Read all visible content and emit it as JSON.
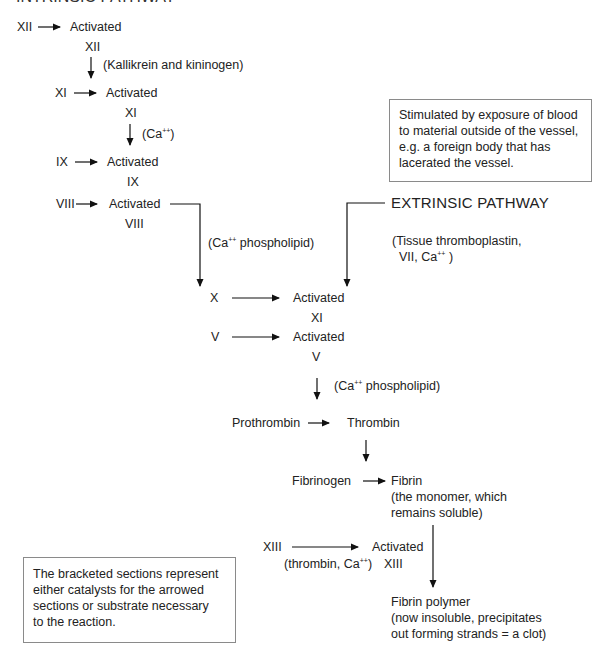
{
  "title": "INTRINSIC PATHWAY",
  "intrinsic": {
    "xii": {
      "source": "XII",
      "activated": "Activated",
      "sub": "XII"
    },
    "xii_catalyst": "(Kallikrein and kininogen)",
    "xi": {
      "source": "XI",
      "activated": "Activated",
      "sub": "XI"
    },
    "xi_catalyst_pre": "(Ca",
    "xi_catalyst_sup": "++",
    "xi_catalyst_post": ")",
    "ix": {
      "source": "IX",
      "activated": "Activated",
      "sub": "IX"
    },
    "viii": {
      "source": "VIII",
      "activated": "Activated",
      "sub": "VIII"
    },
    "viii_catalyst_pre": "(Ca",
    "viii_catalyst_sup": "++",
    "viii_catalyst_post": " phospholipid)"
  },
  "extrinsic": {
    "note": "Stimulated by exposure of blood\nto material outside of the vessel,\ne.g. a foreign body that has\nlacerated the vessel.",
    "label": "EXTRINSIC PATHWAY",
    "catalyst_line1": "(Tissue thromboplastin,",
    "catalyst_line2_pre": "VII, Ca",
    "catalyst_line2_sup": "++",
    "catalyst_line2_post": " )"
  },
  "common": {
    "x": {
      "source": "X",
      "activated": "Activated",
      "sub": "XI"
    },
    "v": {
      "source": "V",
      "activated": "Activated",
      "sub": "V"
    },
    "v_catalyst_pre": "(Ca",
    "v_catalyst_sup": "++",
    "v_catalyst_post": " phospholipid)",
    "prothrombin": "Prothrombin",
    "thrombin": "Thrombin",
    "fibrinogen": "Fibrinogen",
    "fibrin": "Fibrin",
    "fibrin_note1": "(the monomer, which",
    "fibrin_note2": "remains soluble)",
    "xiii": {
      "source": "XIII",
      "activated": "Activated",
      "sub": "XIII"
    },
    "xiii_catalyst_pre": "(thrombin, Ca",
    "xiii_catalyst_sup": "++",
    "xiii_catalyst_post": ")",
    "polymer": "Fibrin polymer",
    "polymer_note1": "(now insoluble, precipitates",
    "polymer_note2": "out forming strands = a clot)"
  },
  "legend_note": "The bracketed sections represent\neither catalysts for the arrowed\nsections or substrate necessary\nto the reaction."
}
